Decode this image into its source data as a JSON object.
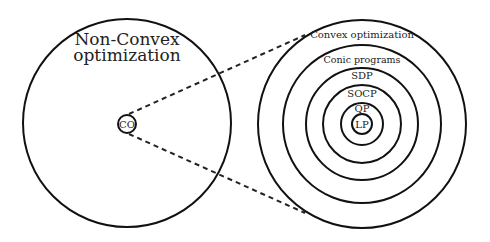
{
  "diagram": {
    "left": {
      "title_line1": "Non-Convex",
      "title_line2": "optimization",
      "inner_label": "CO"
    },
    "right": {
      "rings": [
        {
          "label": "Convex  optimization"
        },
        {
          "label": "Conic programs"
        },
        {
          "label": "SDP"
        },
        {
          "label": "SOCP"
        },
        {
          "label": "QP"
        },
        {
          "label": "LP"
        }
      ]
    },
    "colors": {
      "stroke": "#111111",
      "background": "#ffffff"
    }
  }
}
